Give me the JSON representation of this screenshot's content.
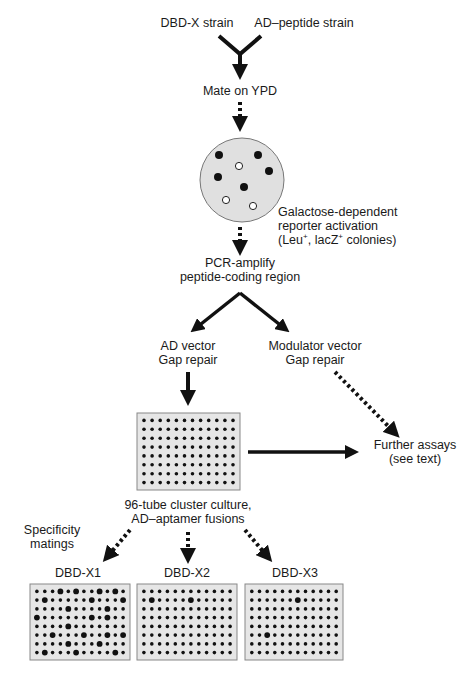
{
  "colors": {
    "arrow": "#111111",
    "plate_fill": "#e6e6e6",
    "plate_border": "#888888",
    "dish_fill": "#e0e0e0",
    "text": "#1a1a1a"
  },
  "nodes": {
    "dbd_strain": "DBD-X strain",
    "ad_strain": "AD–peptide strain",
    "mate": "Mate on YPD",
    "reporter_line1": "Galactose-dependent",
    "reporter_line2": "reporter activation",
    "reporter_line3_a": "(Leu",
    "reporter_line3_b": ", lacZ",
    "reporter_line3_c": " colonies)",
    "plus": "+",
    "pcr_line1": "PCR-amplify",
    "pcr_line2": "peptide-coding region",
    "ad_vector_line1": "AD vector",
    "ad_vector_line2": "Gap repair",
    "mod_vector_line1": "Modulator vector",
    "mod_vector_line2": "Gap repair",
    "further_line1": "Further assays",
    "further_line2": "(see text)",
    "culture_line1": "96-tube cluster culture,",
    "culture_line2": "AD–aptamer fusions",
    "specificity_line1": "Specificity",
    "specificity_line2": "matings"
  },
  "dish": {
    "filled_colonies": [
      [
        219,
        155
      ],
      [
        258,
        155
      ],
      [
        269,
        171
      ],
      [
        218,
        177
      ],
      [
        244,
        187
      ]
    ],
    "open_colonies": [
      [
        239,
        166
      ],
      [
        226,
        200
      ],
      [
        253,
        206
      ]
    ]
  },
  "main_plate": {
    "rows": 8,
    "cols": 12,
    "big_wells": []
  },
  "specificity_plates": [
    {
      "label": "DBD-X1",
      "big_wells": [
        [
          1,
          4
        ],
        [
          1,
          6
        ],
        [
          1,
          9
        ],
        [
          1,
          11
        ],
        [
          2,
          2
        ],
        [
          2,
          8
        ],
        [
          2,
          12
        ],
        [
          3,
          5
        ],
        [
          3,
          10
        ],
        [
          4,
          1
        ],
        [
          4,
          8
        ],
        [
          4,
          10
        ],
        [
          5,
          5
        ],
        [
          6,
          3
        ],
        [
          6,
          7
        ],
        [
          6,
          10
        ],
        [
          6,
          12
        ],
        [
          7,
          5
        ],
        [
          7,
          9
        ],
        [
          8,
          2
        ],
        [
          8,
          6
        ],
        [
          8,
          11
        ]
      ]
    },
    {
      "label": "DBD-X2",
      "big_wells": [
        [
          2,
          2
        ],
        [
          2,
          7
        ]
      ]
    },
    {
      "label": "DBD-X3",
      "big_wells": [
        [
          2,
          7
        ],
        [
          6,
          3
        ]
      ]
    }
  ]
}
